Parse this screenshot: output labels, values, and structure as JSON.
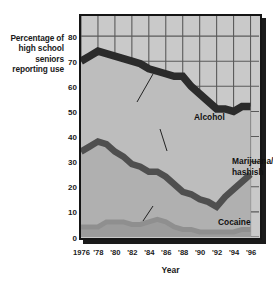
{
  "axis": {
    "y_title_lines": [
      "Percentage of",
      "high school",
      "seniors",
      "reporting use"
    ],
    "x_title": "Year",
    "y_ticks": [
      "0",
      "10",
      "20",
      "30",
      "40",
      "50",
      "60",
      "70",
      "80"
    ],
    "x_ticks": [
      "1976",
      "'78",
      "'80",
      "'82",
      "'84",
      "'86",
      "'88",
      "'90",
      "'92",
      "'94",
      "'96"
    ]
  },
  "annotations": {
    "alcohol": "Alcohol",
    "marijuana_line1": "Marijuana/",
    "marijuana_line2": "hashish",
    "cocaine": "Cocaine"
  },
  "colors": {
    "plot_background": "#c9c9c9",
    "gridline": "#5a5a5a",
    "frame": "#151515",
    "alcohol_band": "#2b2b2b",
    "marijuana_band": "#4f4f4f",
    "cocaine_band": "#8f8f8f",
    "alcohol_fill": "#bdbdbd",
    "marijuana_fill": "#b0b0b0",
    "cocaine_fill": "#9c9c9c",
    "text": "#1a1a1a"
  },
  "chart_data": {
    "type": "area",
    "title": "",
    "xlabel": "Year",
    "ylabel": "Percentage of high school seniors reporting use",
    "xlim": [
      1976,
      1997
    ],
    "ylim": [
      0,
      88
    ],
    "grid": true,
    "legend": "in-plot annotations",
    "x": [
      1976,
      1977,
      1978,
      1979,
      1980,
      1981,
      1982,
      1983,
      1984,
      1985,
      1986,
      1987,
      1988,
      1989,
      1990,
      1991,
      1992,
      1993,
      1994,
      1995,
      1996
    ],
    "series": [
      {
        "name": "Alcohol",
        "values": [
          70,
          72,
          74,
          73,
          72,
          71,
          70,
          69,
          67,
          66,
          65,
          64,
          64,
          60,
          57,
          54,
          51,
          51,
          50,
          52,
          52
        ]
      },
      {
        "name": "Marijuana/hashish",
        "values": [
          34,
          36,
          38,
          37,
          34,
          32,
          29,
          28,
          26,
          26,
          24,
          21,
          18,
          17,
          15,
          14,
          12,
          16,
          19,
          22,
          25
        ]
      },
      {
        "name": "Cocaine",
        "values": [
          4,
          4,
          4,
          6,
          6,
          6,
          5,
          5,
          6,
          7,
          6,
          4,
          3,
          3,
          2,
          2,
          2,
          2,
          2,
          3,
          3
        ]
      }
    ]
  }
}
